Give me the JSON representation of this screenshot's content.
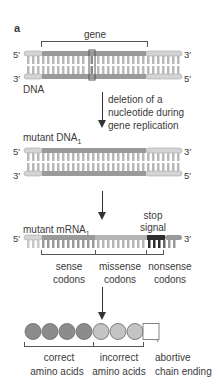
{
  "panel_label": "a",
  "gene_label": "gene",
  "dna": {
    "label": "DNA",
    "top_left": "5′",
    "top_right": "3′",
    "bottom_left": "3′",
    "bottom_right": "5′"
  },
  "step1": {
    "text_line1": "deletion of a",
    "text_line2": "nucleotide during",
    "text_line3": "gene replication"
  },
  "mutant_dna": {
    "label": "mutant DNA",
    "subscript": "1",
    "top_left": "5′",
    "top_right": "3′",
    "bottom_left": "3′",
    "bottom_right": "5′"
  },
  "mrna": {
    "label": "mutant mRNA",
    "subscript": "1",
    "left": "5′",
    "right": "3′",
    "stop_line1": "stop",
    "stop_line2": "signal"
  },
  "codons": [
    {
      "line1": "sense",
      "line2": "codons"
    },
    {
      "line1": "missense",
      "line2": "codons"
    },
    {
      "line1": "nonsense",
      "line2": "codons"
    }
  ],
  "amino": [
    {
      "line1": "correct",
      "line2": "amino acids"
    },
    {
      "line1": "incorrect",
      "line2": "amino acids"
    },
    {
      "line1": "abortive",
      "line2": "chain ending"
    }
  ],
  "colors": {
    "light_segment": "#d4d4d4",
    "gene_segment": "#9a9a9a",
    "mid_segment": "#b5b5b5",
    "stop_segment": "#2e2e2e",
    "correct_circle": "#8c8c8c",
    "incorrect_circle": "#c4c4c4",
    "bracket": "#555555"
  }
}
